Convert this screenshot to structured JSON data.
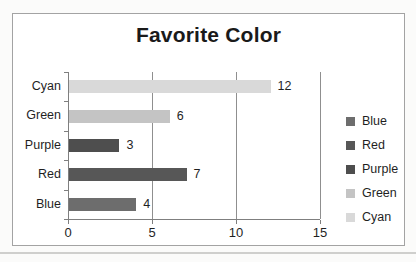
{
  "chart_data": {
    "type": "bar",
    "orientation": "horizontal",
    "title": "Favorite Color",
    "categories": [
      "Cyan",
      "Green",
      "Purple",
      "Red",
      "Blue"
    ],
    "values": [
      12,
      6,
      3,
      7,
      4
    ],
    "bar_colors": [
      "#d9d9d9",
      "#c4c4c4",
      "#4e4e4e",
      "#575757",
      "#6d6d6d"
    ],
    "data_labels": [
      "12",
      "6",
      "3",
      "7",
      "4"
    ],
    "xlim": [
      0,
      15
    ],
    "x_ticks": [
      0,
      5,
      10,
      15
    ],
    "x_tick_labels": [
      "0",
      "5",
      "10",
      "15"
    ],
    "grid": true,
    "legend": {
      "position": "right",
      "entries": [
        {
          "label": "Blue",
          "color": "#6d6d6d"
        },
        {
          "label": "Red",
          "color": "#575757"
        },
        {
          "label": "Purple",
          "color": "#4e4e4e"
        },
        {
          "label": "Green",
          "color": "#c4c4c4"
        },
        {
          "label": "Cyan",
          "color": "#d9d9d9"
        }
      ]
    },
    "style": {
      "axis_color": "#7f7f7f",
      "gridline_color": "#8f8f8f",
      "text_color": "#1f1f1f",
      "chart_border_color": "#a3a3a3",
      "plot_background": "#ffffff"
    }
  }
}
